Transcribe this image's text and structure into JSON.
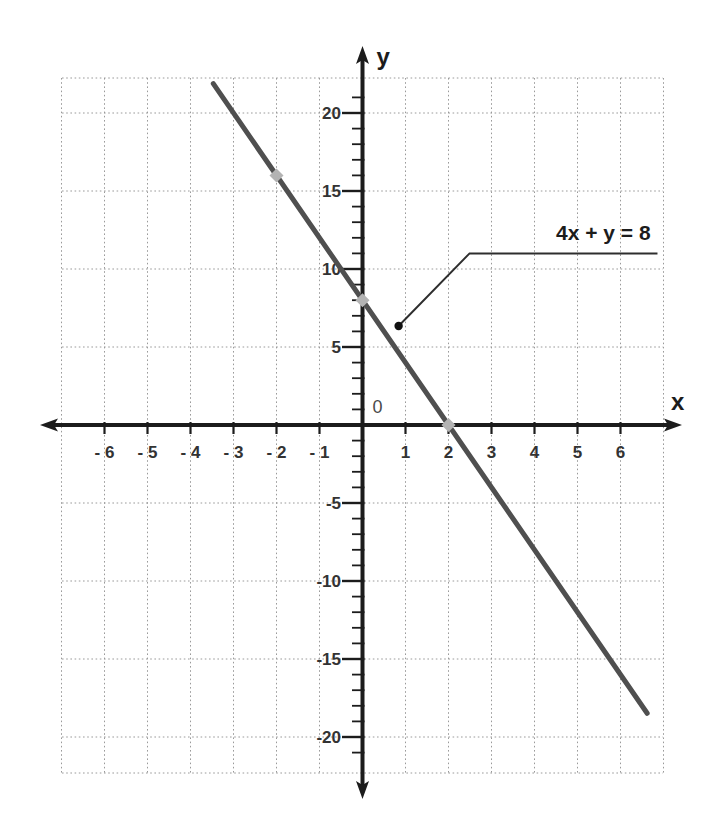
{
  "chart_data": {
    "type": "line",
    "title": "",
    "equation": "4x + y = 8",
    "series": [
      {
        "name": "4x + y = 8",
        "slope": -4,
        "y_intercept": 8,
        "x_intercept": 2,
        "x_start": -3.47,
        "x_end": 6.62
      }
    ],
    "highlight_points": [
      {
        "x": -2,
        "y": 16
      },
      {
        "x": 0,
        "y": 8
      },
      {
        "x": 2,
        "y": 0
      }
    ],
    "annotation": {
      "text": "4x + y = 8",
      "dot": {
        "x": 0.84,
        "y": 6.35
      },
      "elbow": {
        "x": 2.49,
        "y": 11.0
      },
      "end": {
        "x": 6.86,
        "y": 11.0
      },
      "label_center": {
        "x": 5.6,
        "y": 12.4
      }
    },
    "x_axis": {
      "label": "x",
      "range": [
        -7,
        7
      ],
      "grid_step": 1,
      "ticks": [
        {
          "v": -6,
          "t": "- 6"
        },
        {
          "v": -5,
          "t": "- 5"
        },
        {
          "v": -4,
          "t": "- 4"
        },
        {
          "v": -3,
          "t": "- 3"
        },
        {
          "v": -2,
          "t": "- 2"
        },
        {
          "v": -1,
          "t": "- 1"
        },
        {
          "v": 1,
          "t": "1"
        },
        {
          "v": 2,
          "t": "2"
        },
        {
          "v": 3,
          "t": "3"
        },
        {
          "v": 4,
          "t": "4"
        },
        {
          "v": 5,
          "t": "5"
        },
        {
          "v": 6,
          "t": "6"
        }
      ]
    },
    "y_axis": {
      "label": "y",
      "range": [
        -22.3,
        22.3
      ],
      "grid_step": 5,
      "minor_tick_step": 1,
      "ticks": [
        {
          "v": 20,
          "t": "20"
        },
        {
          "v": 15,
          "t": "15"
        },
        {
          "v": 10,
          "t": "10"
        },
        {
          "v": 5,
          "t": "5"
        },
        {
          "v": -5,
          "t": "-5"
        },
        {
          "v": -10,
          "t": "-10"
        },
        {
          "v": -15,
          "t": "-15"
        },
        {
          "v": -20,
          "t": "-20"
        }
      ]
    },
    "origin_label": "0",
    "grid": true,
    "legend": false,
    "colors": {
      "axis": "#1c1c1c",
      "grid": "#9a9a9a",
      "line": "#4f4f4f",
      "marker": "#b3b3b3",
      "leader": "#2e2e2e",
      "leader_dot": "#111111",
      "labels": "#333333",
      "origin": "#4a4a4a",
      "background": "#ffffff"
    }
  }
}
